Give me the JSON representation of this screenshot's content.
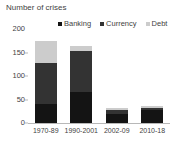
{
  "chart_data": {
    "type": "bar",
    "subtype": "stacked-vertical",
    "title": "Number of crises",
    "xlabel": "",
    "ylabel": "",
    "ylim": [
      0,
      200
    ],
    "yticks": [
      0,
      50,
      100,
      150,
      200
    ],
    "ytick_labels": [
      "0",
      "50",
      "100",
      "150",
      "200"
    ],
    "grid": false,
    "legend_position": "top-right",
    "categories": [
      "1970-89",
      "1990-2001",
      "2002-09",
      "2010-18"
    ],
    "series": [
      {
        "name": "Banking",
        "color": "#141414",
        "values": [
          40,
          65,
          20,
          28
        ]
      },
      {
        "name": "Currency",
        "color": "#333333",
        "values": [
          88,
          88,
          7,
          5
        ]
      },
      {
        "name": "Debt",
        "color": "#cccccc",
        "values": [
          47,
          10,
          5,
          3
        ]
      }
    ],
    "totals": [
      175,
      163,
      32,
      36
    ]
  },
  "colors": {
    "banking": "#141414",
    "currency": "#333333",
    "debt": "#cccccc",
    "axis": "#b8b8b8",
    "text": "#3f3f3f",
    "background": "#ffffff"
  }
}
